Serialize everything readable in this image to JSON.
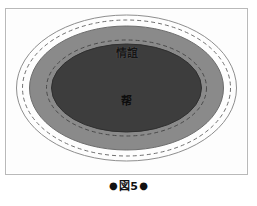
{
  "figure": {
    "caption_bullet_left": "●",
    "caption_text": "図5",
    "caption_bullet_right": "●",
    "caption_full": "●図5●"
  },
  "diagram": {
    "type": "concentric-ellipse-venn",
    "background_color": "#fdfdfd",
    "frame_border_color": "#b9b9b9",
    "labels": {
      "outer_ring": "情誼",
      "inner_core": "帮"
    },
    "rings": [
      {
        "name": "outer-solid-outline",
        "style": "solid",
        "stroke_color": "#8e8e8e",
        "fill": "none",
        "rx": 110,
        "ry": 73
      },
      {
        "name": "outer-dashed-outline",
        "style": "dashed",
        "stroke_color": "#6f6f6f",
        "fill": "none",
        "rx": 104,
        "ry": 68
      },
      {
        "name": "mid-gray-band",
        "style": "solid",
        "stroke_color": "#6d6d6d",
        "fill": "#8a8a8a",
        "rx": 97,
        "ry": 62
      },
      {
        "name": "inner-dashed-outline",
        "style": "dashed",
        "stroke_color": "#4a4a4a",
        "fill": "none",
        "rx": 80,
        "ry": 48
      },
      {
        "name": "inner-dark-core",
        "style": "solid",
        "stroke_color": "#2f2f2f",
        "fill": "#3d3d3d",
        "rx": 75,
        "ry": 44
      }
    ]
  }
}
